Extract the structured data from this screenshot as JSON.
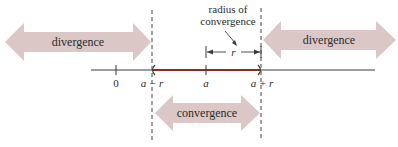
{
  "diagram": {
    "type": "number-line",
    "colors": {
      "arrow_fill": "#dbc8c6",
      "interval": "#8a2b24",
      "axis": "#3a3a3a",
      "dashed": "#444444",
      "text": "#2b2b2b"
    },
    "regions": {
      "left": {
        "label": "divergence"
      },
      "right": {
        "label": "divergence"
      },
      "center": {
        "label": "convergence"
      }
    },
    "annotation": {
      "line1": "radius of",
      "line2": "convergence",
      "symbol": "r"
    },
    "ticks": [
      {
        "label": "0"
      },
      {
        "label": "a − r"
      },
      {
        "label": "a"
      },
      {
        "label": "a + r"
      }
    ]
  }
}
